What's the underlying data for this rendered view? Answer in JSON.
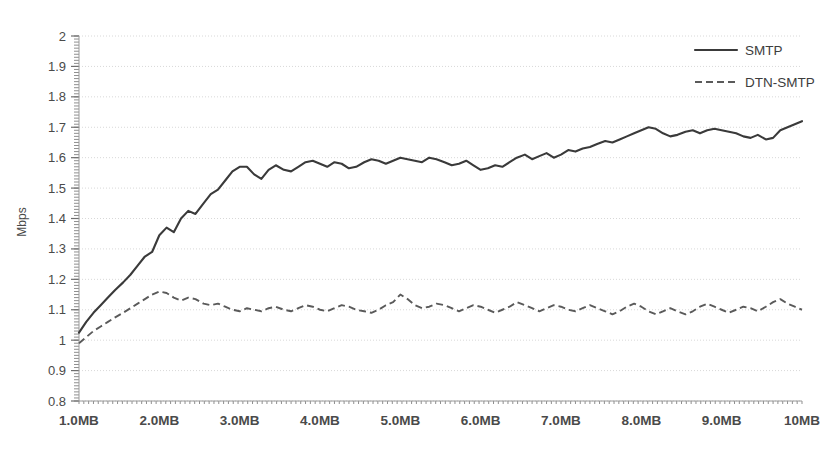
{
  "chart_data": {
    "type": "line",
    "title": "",
    "subtitle": "",
    "xlabel": "",
    "ylabel": "Mbps",
    "xlim": [
      1.0,
      10.0
    ],
    "ylim": [
      0.8,
      2.0
    ],
    "grid": true,
    "grid_axis": "y",
    "legend_position": "top-right",
    "x_tick_labels": [
      "1.0MB",
      "2.0MB",
      "3.0MB",
      "4.0MB",
      "5.0MB",
      "6.0MB",
      "7.0MB",
      "8.0MB",
      "9.0MB",
      "10MB"
    ],
    "x_tick_values": [
      1,
      2,
      3,
      4,
      5,
      6,
      7,
      8,
      9,
      10
    ],
    "y_tick_labels": [
      "2",
      "1.9",
      "1.8",
      "1.7",
      "1.6",
      "1.5",
      "1.4",
      "1.3",
      "1.2",
      "1.1",
      "1",
      "0.9",
      "0.8"
    ],
    "y_tick_values": [
      2.0,
      1.9,
      1.8,
      1.7,
      1.6,
      1.5,
      1.4,
      1.3,
      1.2,
      1.1,
      1.0,
      0.9,
      0.8
    ],
    "x": [
      1.0,
      1.09,
      1.18,
      1.27,
      1.36,
      1.45,
      1.55,
      1.64,
      1.73,
      1.82,
      1.91,
      2.0,
      2.09,
      2.18,
      2.27,
      2.36,
      2.45,
      2.55,
      2.64,
      2.73,
      2.82,
      2.91,
      3.0,
      3.09,
      3.18,
      3.27,
      3.36,
      3.45,
      3.55,
      3.64,
      3.73,
      3.82,
      3.91,
      4.0,
      4.09,
      4.18,
      4.27,
      4.36,
      4.45,
      4.55,
      4.64,
      4.73,
      4.82,
      4.91,
      5.0,
      5.09,
      5.18,
      5.27,
      5.36,
      5.45,
      5.55,
      5.64,
      5.73,
      5.82,
      5.91,
      6.0,
      6.09,
      6.18,
      6.27,
      6.36,
      6.45,
      6.55,
      6.64,
      6.73,
      6.82,
      6.91,
      7.0,
      7.09,
      7.18,
      7.27,
      7.36,
      7.45,
      7.55,
      7.64,
      7.73,
      7.82,
      7.91,
      8.0,
      8.09,
      8.18,
      8.27,
      8.36,
      8.45,
      8.55,
      8.64,
      8.73,
      8.82,
      8.91,
      9.0,
      9.09,
      9.18,
      9.27,
      9.36,
      9.45,
      9.55,
      9.64,
      9.73,
      9.82,
      9.91,
      10.0
    ],
    "series": [
      {
        "name": "SMTP",
        "style": "solid",
        "color": "#3a3a3a",
        "values": [
          1.025,
          1.06,
          1.09,
          1.115,
          1.14,
          1.165,
          1.19,
          1.215,
          1.245,
          1.275,
          1.29,
          1.345,
          1.37,
          1.355,
          1.4,
          1.425,
          1.415,
          1.45,
          1.48,
          1.495,
          1.525,
          1.555,
          1.57,
          1.57,
          1.545,
          1.53,
          1.56,
          1.575,
          1.56,
          1.555,
          1.57,
          1.585,
          1.59,
          1.58,
          1.57,
          1.585,
          1.58,
          1.565,
          1.57,
          1.585,
          1.595,
          1.59,
          1.58,
          1.59,
          1.6,
          1.595,
          1.59,
          1.585,
          1.6,
          1.595,
          1.585,
          1.575,
          1.58,
          1.59,
          1.575,
          1.56,
          1.565,
          1.575,
          1.57,
          1.585,
          1.6,
          1.61,
          1.595,
          1.605,
          1.615,
          1.6,
          1.61,
          1.625,
          1.62,
          1.63,
          1.635,
          1.645,
          1.655,
          1.65,
          1.66,
          1.67,
          1.68,
          1.69,
          1.7,
          1.695,
          1.68,
          1.67,
          1.675,
          1.685,
          1.69,
          1.68,
          1.69,
          1.695,
          1.69,
          1.685,
          1.68,
          1.67,
          1.665,
          1.675,
          1.66,
          1.665,
          1.69,
          1.7,
          1.71,
          1.72
        ]
      },
      {
        "name": "DTN-SMTP",
        "style": "dashed",
        "color": "#5a5a5a",
        "values": [
          0.99,
          1.01,
          1.03,
          1.045,
          1.06,
          1.075,
          1.09,
          1.105,
          1.12,
          1.135,
          1.15,
          1.16,
          1.155,
          1.14,
          1.13,
          1.14,
          1.135,
          1.12,
          1.115,
          1.12,
          1.11,
          1.1,
          1.095,
          1.105,
          1.1,
          1.095,
          1.105,
          1.11,
          1.1,
          1.095,
          1.105,
          1.115,
          1.11,
          1.1,
          1.095,
          1.105,
          1.115,
          1.11,
          1.1,
          1.095,
          1.09,
          1.1,
          1.115,
          1.125,
          1.15,
          1.135,
          1.115,
          1.105,
          1.11,
          1.12,
          1.115,
          1.105,
          1.095,
          1.105,
          1.115,
          1.11,
          1.1,
          1.09,
          1.1,
          1.11,
          1.125,
          1.115,
          1.105,
          1.095,
          1.105,
          1.115,
          1.11,
          1.1,
          1.095,
          1.105,
          1.115,
          1.105,
          1.095,
          1.085,
          1.095,
          1.11,
          1.12,
          1.11,
          1.095,
          1.085,
          1.095,
          1.105,
          1.095,
          1.085,
          1.095,
          1.11,
          1.12,
          1.11,
          1.1,
          1.09,
          1.1,
          1.11,
          1.105,
          1.095,
          1.11,
          1.125,
          1.135,
          1.12,
          1.11,
          1.1
        ]
      }
    ],
    "legend": [
      {
        "label": "SMTP",
        "style": "solid"
      },
      {
        "label": "DTN-SMTP",
        "style": "dashed"
      }
    ]
  },
  "axis": {
    "y_title": "Mbps"
  }
}
